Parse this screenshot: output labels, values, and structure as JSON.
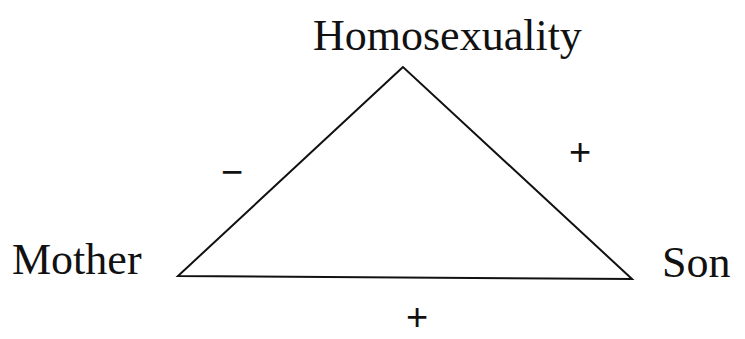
{
  "diagram": {
    "type": "balance-triangle",
    "nodes": {
      "top": {
        "label": "Homosexuality"
      },
      "left": {
        "label": "Mother"
      },
      "right": {
        "label": "Son"
      }
    },
    "edges": {
      "left_edge": {
        "from": "Mother",
        "to": "Homosexuality",
        "sign": "−"
      },
      "right_edge": {
        "from": "Son",
        "to": "Homosexuality",
        "sign": "+"
      },
      "bottom_edge": {
        "from": "Mother",
        "to": "Son",
        "sign": "+"
      }
    },
    "line_color": "#111111"
  }
}
